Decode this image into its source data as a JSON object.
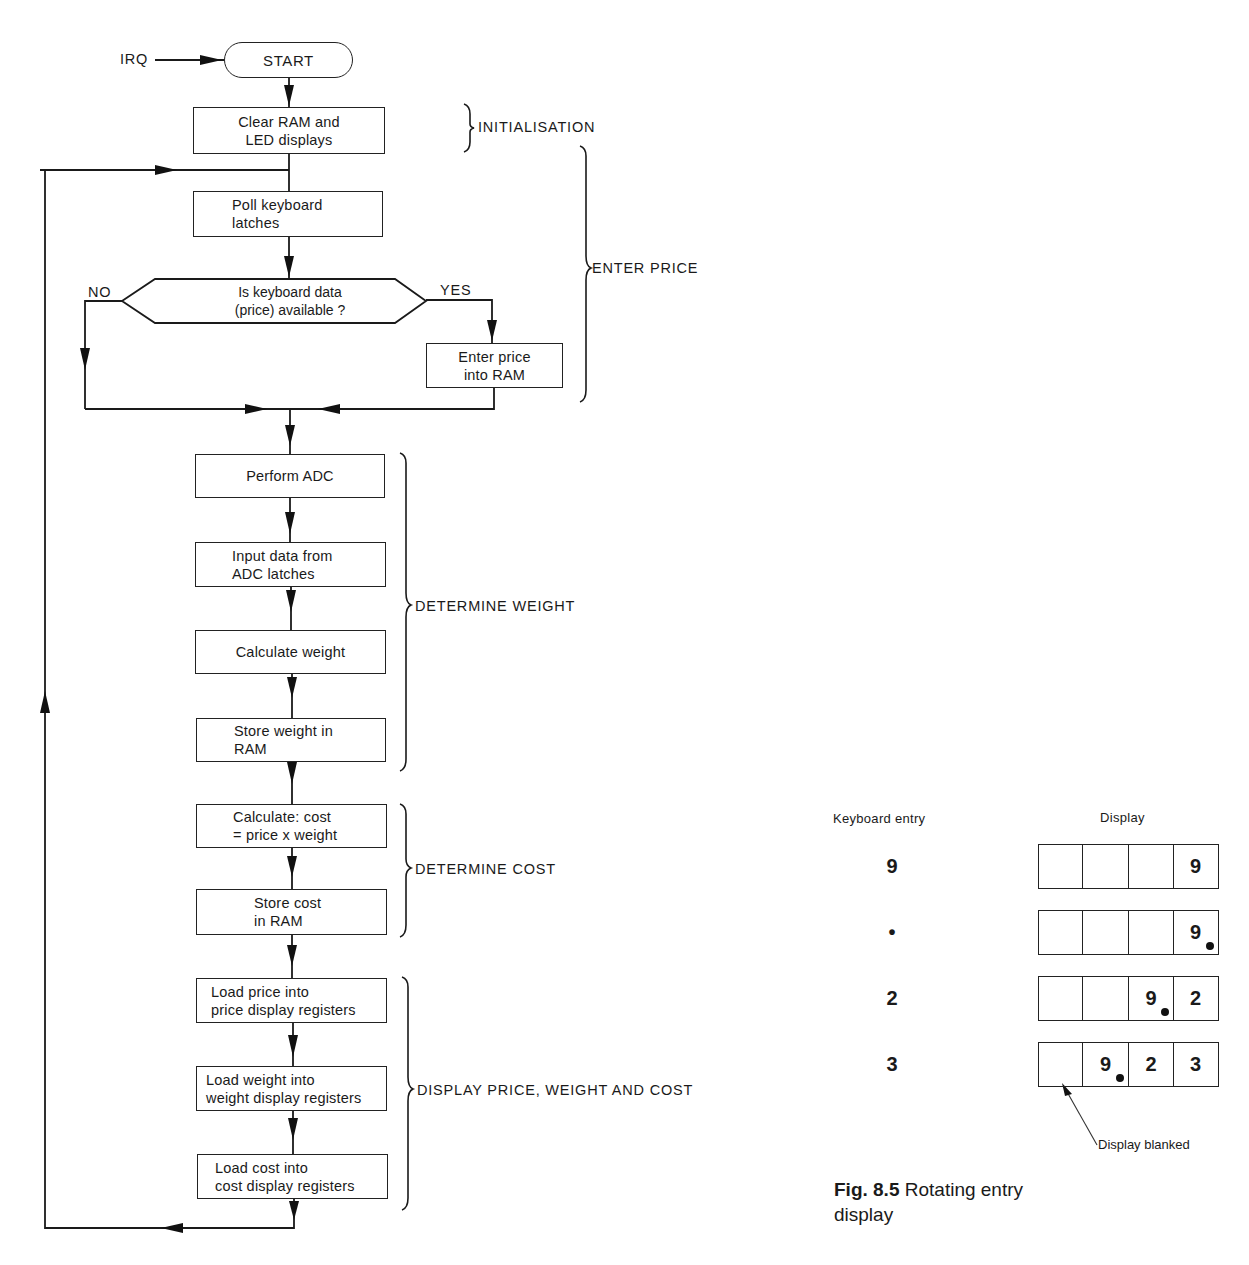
{
  "flowchart": {
    "irq_label": "IRQ",
    "start_label": "START",
    "steps": {
      "clear_ram": [
        "Clear RAM and",
        "LED displays"
      ],
      "poll_keyboard": [
        "Poll keyboard",
        "latches"
      ],
      "decision": [
        "Is keyboard data",
        "(price) available ?"
      ],
      "enter_price": [
        "Enter price",
        "into RAM"
      ],
      "perform_adc": [
        "Perform ADC"
      ],
      "input_data": [
        "Input data from",
        "ADC latches"
      ],
      "calculate_weight": [
        "Calculate weight"
      ],
      "store_weight": [
        "Store weight in",
        "RAM"
      ],
      "calculate_cost": [
        "Calculate: cost",
        "= price x weight"
      ],
      "store_cost": [
        "Store cost",
        "in RAM"
      ],
      "load_price": [
        "Load price into",
        "price display registers"
      ],
      "load_weight": [
        "Load weight into",
        "weight display registers"
      ],
      "load_cost": [
        "Load cost into",
        "cost display registers"
      ]
    },
    "branch_labels": {
      "no": "NO",
      "yes": "YES"
    },
    "groups": {
      "initialisation": "INITIALISATION",
      "enter_price": "ENTER PRICE",
      "determine_weight": "DETERMINE WEIGHT",
      "determine_cost": "DETERMINE COST",
      "display": "DISPLAY PRICE, WEIGHT AND COST"
    }
  },
  "figure_8_5": {
    "header_entry": "Keyboard entry",
    "header_display": "Display",
    "rows": [
      {
        "entry": "9",
        "cells": [
          "",
          "",
          "",
          "9"
        ],
        "dp_cell": -1
      },
      {
        "entry": "•",
        "cells": [
          "",
          "",
          "",
          "9"
        ],
        "dp_cell": 3
      },
      {
        "entry": "2",
        "cells": [
          "",
          "",
          "9",
          "2"
        ],
        "dp_cell": 2
      },
      {
        "entry": "3",
        "cells": [
          "",
          "9",
          "2",
          "3"
        ],
        "dp_cell": 1
      }
    ],
    "annotation": "Display blanked",
    "caption_number": "Fig. 8.5",
    "caption_line1": "Rotating entry",
    "caption_line2": "display"
  }
}
